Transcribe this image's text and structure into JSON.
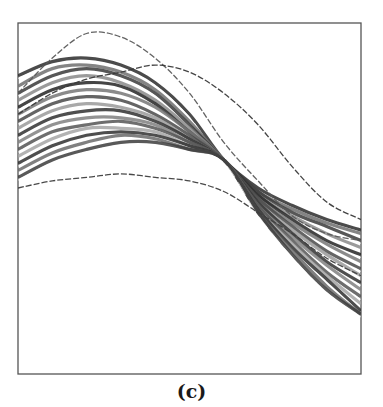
{
  "figure": {
    "caption": "(c)",
    "frame": {
      "x": 18,
      "y": 23,
      "width": 343,
      "height": 351,
      "stroke": "#555555"
    }
  },
  "chart_data": {
    "type": "line",
    "title": "",
    "xlabel": "",
    "ylabel": "",
    "axes_ticks": "none",
    "grid": false,
    "legend": "none",
    "x": [
      0.0,
      0.1,
      0.2,
      0.3,
      0.4,
      0.5,
      0.6,
      0.7,
      0.8,
      0.9,
      1.0
    ],
    "series": [
      {
        "name": "bundle-01",
        "color": "#2b2b2b",
        "values": [
          0.85,
          0.89,
          0.9,
          0.88,
          0.83,
          0.74,
          0.61,
          0.53,
          0.48,
          0.44,
          0.41
        ]
      },
      {
        "name": "bundle-02",
        "color": "#6e6e6e",
        "values": [
          0.82,
          0.87,
          0.88,
          0.86,
          0.81,
          0.72,
          0.61,
          0.52,
          0.47,
          0.43,
          0.4
        ]
      },
      {
        "name": "bundle-03",
        "color": "#3a3a3a",
        "values": [
          0.8,
          0.85,
          0.87,
          0.85,
          0.8,
          0.71,
          0.61,
          0.52,
          0.46,
          0.42,
          0.38
        ]
      },
      {
        "name": "bundle-04",
        "color": "#8a8a8a",
        "values": [
          0.78,
          0.83,
          0.85,
          0.83,
          0.78,
          0.7,
          0.61,
          0.51,
          0.45,
          0.4,
          0.36
        ]
      },
      {
        "name": "bundle-05",
        "color": "#242424",
        "values": [
          0.76,
          0.81,
          0.83,
          0.82,
          0.77,
          0.69,
          0.61,
          0.51,
          0.44,
          0.38,
          0.34
        ]
      },
      {
        "name": "bundle-06",
        "color": "#777777",
        "values": [
          0.74,
          0.79,
          0.81,
          0.8,
          0.76,
          0.69,
          0.61,
          0.5,
          0.43,
          0.37,
          0.32
        ]
      },
      {
        "name": "bundle-07",
        "color": "#4a4a4a",
        "values": [
          0.72,
          0.77,
          0.79,
          0.78,
          0.74,
          0.68,
          0.61,
          0.5,
          0.42,
          0.35,
          0.3
        ]
      },
      {
        "name": "bundle-08",
        "color": "#9a9a9a",
        "values": [
          0.7,
          0.75,
          0.77,
          0.76,
          0.73,
          0.67,
          0.61,
          0.49,
          0.41,
          0.34,
          0.28
        ]
      },
      {
        "name": "bundle-09",
        "color": "#303030",
        "values": [
          0.68,
          0.73,
          0.75,
          0.75,
          0.72,
          0.67,
          0.61,
          0.49,
          0.4,
          0.32,
          0.26
        ]
      },
      {
        "name": "bundle-10",
        "color": "#808080",
        "values": [
          0.66,
          0.71,
          0.73,
          0.73,
          0.71,
          0.66,
          0.61,
          0.48,
          0.39,
          0.31,
          0.24
        ]
      },
      {
        "name": "bundle-11",
        "color": "#555555",
        "values": [
          0.64,
          0.69,
          0.71,
          0.72,
          0.7,
          0.66,
          0.61,
          0.48,
          0.38,
          0.29,
          0.22
        ]
      },
      {
        "name": "bundle-12",
        "color": "#a5a5a5",
        "values": [
          0.62,
          0.67,
          0.7,
          0.7,
          0.69,
          0.65,
          0.61,
          0.47,
          0.37,
          0.28,
          0.2
        ]
      },
      {
        "name": "bundle-13",
        "color": "#2f2f2f",
        "values": [
          0.6,
          0.65,
          0.68,
          0.69,
          0.68,
          0.65,
          0.61,
          0.47,
          0.36,
          0.27,
          0.18
        ]
      },
      {
        "name": "bundle-14",
        "color": "#6a6a6a",
        "values": [
          0.58,
          0.63,
          0.66,
          0.68,
          0.67,
          0.64,
          0.61,
          0.46,
          0.35,
          0.25,
          0.17
        ]
      },
      {
        "name": "bundle-15",
        "color": "#3c3c3c",
        "values": [
          0.56,
          0.61,
          0.64,
          0.66,
          0.66,
          0.64,
          0.61,
          0.46,
          0.34,
          0.24,
          0.17
        ]
      },
      {
        "name": "outlier-top",
        "color": "#5a5a5a",
        "values": [
          0.8,
          0.9,
          0.97,
          0.96,
          0.9,
          0.8,
          0.66,
          0.55,
          0.45,
          0.4,
          0.38
        ]
      },
      {
        "name": "outlier-late-peak",
        "color": "#3a3a3a",
        "values": [
          0.74,
          0.8,
          0.84,
          0.86,
          0.88,
          0.86,
          0.8,
          0.71,
          0.59,
          0.49,
          0.44
        ]
      },
      {
        "name": "outlier-low",
        "color": "#3f3f3f",
        "values": [
          0.53,
          0.55,
          0.56,
          0.57,
          0.56,
          0.55,
          0.52,
          0.46,
          0.4,
          0.33,
          0.28
        ]
      }
    ],
    "xlim": [
      0,
      1
    ],
    "ylim": [
      0,
      1
    ]
  }
}
